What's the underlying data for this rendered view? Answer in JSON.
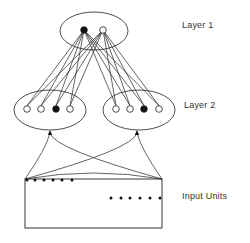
{
  "labels": {
    "layer1": "Layer 1",
    "layer2": "Layer 2",
    "input": "Input Units"
  },
  "colors": {
    "stroke": "#222222",
    "fill_active": "#111111",
    "fill_inactive": "#ffffff",
    "text": "#333333"
  },
  "layer1": {
    "ellipse": {
      "cx": 94,
      "cy": 31,
      "rx": 34,
      "ry": 19
    },
    "nodes": [
      {
        "x": 84,
        "y": 30,
        "active": true
      },
      {
        "x": 103,
        "y": 30,
        "active": false
      }
    ]
  },
  "layer2": {
    "clusters": [
      {
        "ellipse": {
          "cx": 50,
          "cy": 110,
          "rx": 36,
          "ry": 20
        },
        "nodes": [
          {
            "x": 27,
            "y": 109,
            "active": false
          },
          {
            "x": 41,
            "y": 109,
            "active": false
          },
          {
            "x": 56,
            "y": 109,
            "active": true
          },
          {
            "x": 70,
            "y": 109,
            "active": false
          }
        ],
        "arrow_tip": {
          "x": 50,
          "y": 131
        }
      },
      {
        "ellipse": {
          "cx": 139,
          "cy": 110,
          "rx": 36,
          "ry": 20
        },
        "nodes": [
          {
            "x": 116,
            "y": 109,
            "active": false
          },
          {
            "x": 130,
            "y": 109,
            "active": false
          },
          {
            "x": 144,
            "y": 109,
            "active": true
          },
          {
            "x": 159,
            "y": 109,
            "active": false
          }
        ],
        "arrow_tip": {
          "x": 137,
          "y": 131
        }
      }
    ]
  },
  "input": {
    "box": {
      "x": 25,
      "y": 179,
      "w": 137,
      "h": 49
    },
    "dots_top": [
      27,
      35,
      44,
      53,
      62,
      72
    ],
    "dots_top_y": 180,
    "dots_right": [
      111,
      121,
      130,
      140,
      150,
      160
    ],
    "dots_right_y": 198
  }
}
